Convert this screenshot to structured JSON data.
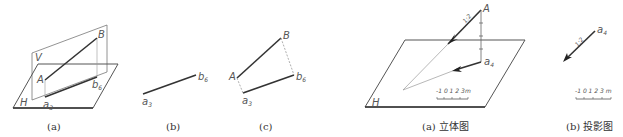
{
  "figures": [
    {
      "id": "a",
      "caption": "(a)",
      "planes": {
        "V": "V",
        "H": "H"
      },
      "points": {
        "A": "A",
        "B": "B",
        "a": "a",
        "a_sub": "3",
        "b": "b",
        "b_sub": "6"
      }
    },
    {
      "id": "b",
      "caption": "(b)",
      "points": {
        "a": "a",
        "a_sub": "3",
        "b": "b",
        "b_sub": "6"
      }
    },
    {
      "id": "c",
      "caption": "(c)",
      "points": {
        "A": "A",
        "B": "B",
        "a": "a",
        "a_sub": "3",
        "b": "b",
        "b_sub": "6"
      }
    }
  ],
  "right_figures": [
    {
      "id": "a3d",
      "caption": "(a) 立体图",
      "plane": "H",
      "slope_label": "1:2",
      "points": {
        "A": "A",
        "a": "a",
        "a_sub": "4"
      },
      "scale_bar": {
        "ticks": [
          "-1",
          "0",
          "1",
          "2",
          "3"
        ],
        "unit": "m"
      }
    },
    {
      "id": "proj",
      "caption": "(b) 投影图",
      "slope_label": "1:2",
      "points": {
        "a": "a",
        "a_sub": "4"
      },
      "scale_bar": {
        "ticks": [
          "-1",
          "0",
          "1",
          "2",
          "3"
        ],
        "unit": "m"
      }
    }
  ],
  "colors": {
    "line": "#333333",
    "thin": "#888888",
    "text": "#555555"
  }
}
